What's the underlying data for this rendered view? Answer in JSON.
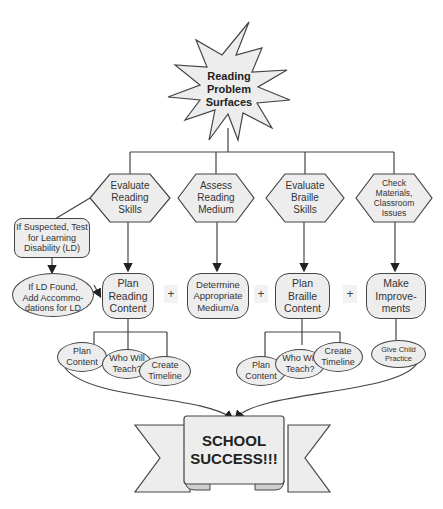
{
  "start": {
    "label_lines": [
      "Reading",
      "Problem",
      "Surfaces"
    ]
  },
  "assessments": [
    {
      "id": "evaluate-reading",
      "lines": [
        "Evaluate",
        "Reading",
        "Skills"
      ]
    },
    {
      "id": "assess-medium",
      "lines": [
        "Assess",
        "Reading",
        "Medium"
      ]
    },
    {
      "id": "evaluate-braille",
      "lines": [
        "Evaluate",
        "Braille",
        "Skills"
      ]
    },
    {
      "id": "check-materials",
      "lines": [
        "Check",
        "Materials,",
        "Classroom",
        "Issues"
      ]
    }
  ],
  "ld_branch": {
    "test": {
      "lines": [
        "If Suspected, Test",
        "for Learning",
        "Disability (LD)"
      ]
    },
    "accommodate": {
      "lines": [
        "If LD Found,",
        "Add Accommo-",
        "dations for LD"
      ]
    }
  },
  "plans": [
    {
      "id": "plan-reading",
      "lines": [
        "Plan",
        "Reading",
        "Content"
      ]
    },
    {
      "id": "determine-medium",
      "lines": [
        "Determine",
        "Appropriate",
        "Medium/a"
      ]
    },
    {
      "id": "plan-braille",
      "lines": [
        "Plan",
        "Braille",
        "Content"
      ]
    },
    {
      "id": "make-improvements",
      "lines": [
        "Make",
        "Improve-",
        "ments"
      ]
    }
  ],
  "plus_sign": "+",
  "reading_subtasks": [
    {
      "lines": [
        "Plan",
        "Content"
      ]
    },
    {
      "lines": [
        "Who Will",
        "Teach?"
      ]
    },
    {
      "lines": [
        "Create",
        "Timeline"
      ]
    }
  ],
  "braille_subtasks": [
    {
      "lines": [
        "Plan",
        "Content"
      ]
    },
    {
      "lines": [
        "Who Will",
        "Teach?"
      ]
    },
    {
      "lines": [
        "Create",
        "Timeline"
      ]
    }
  ],
  "improvement_subtask": {
    "lines": [
      "Give Child",
      "Practice"
    ]
  },
  "outcome": {
    "lines": [
      "SCHOOL",
      "SUCCESS!!!"
    ]
  },
  "colors": {
    "fill": "#ededed",
    "stroke": "#444444",
    "background": "#ffffff"
  }
}
